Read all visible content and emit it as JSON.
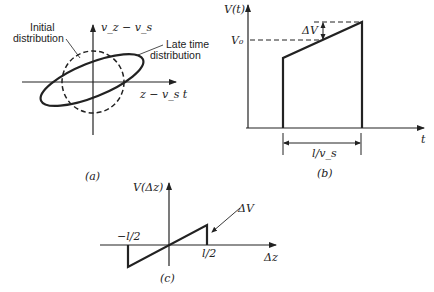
{
  "panel_a": {
    "label": "(a)",
    "y_axis_label": "v_z − v_s",
    "x_axis_label": "z − v_s t",
    "initial_label_line1": "Initial",
    "initial_label_line2": "distribution",
    "late_label_line1": "Late time",
    "late_label_line2": "distribution"
  },
  "panel_b": {
    "label": "(b)",
    "y_axis_label": "V(t)",
    "x_axis_label": "t",
    "v0_label": "V₀",
    "delta_label": "ΔV",
    "width_label": "l/v_s"
  },
  "panel_c": {
    "label": "(c)",
    "y_axis_label": "V(Δz)",
    "x_axis_label": "Δz",
    "left_tick": "−l/2",
    "right_tick": "l/2",
    "delta_label": "ΔV"
  },
  "colors": {
    "ink": "#222222",
    "background": "#ffffff"
  }
}
